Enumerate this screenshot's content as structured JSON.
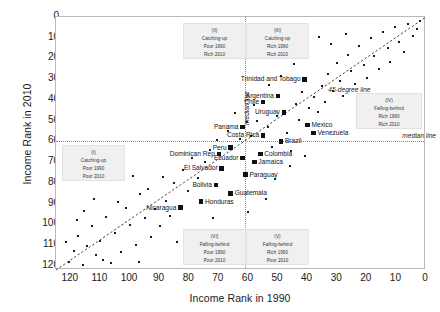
{
  "chart_data": {
    "type": "scatter",
    "title": "",
    "xlabel": "Income Rank in 1990",
    "ylabel": "Income Rank in 2010",
    "xlim": [
      125,
      0
    ],
    "ylim": [
      0,
      122
    ],
    "x_reversed": true,
    "y_reversed": true,
    "xticks": [
      120,
      110,
      100,
      90,
      80,
      70,
      60,
      50,
      40,
      30,
      20,
      10,
      0
    ],
    "yticks": [
      0,
      10,
      20,
      30,
      40,
      50,
      60,
      70,
      80,
      90,
      100,
      110,
      120
    ],
    "grid": false,
    "legend": "none",
    "reference_lines": [
      {
        "name": "45-degree line",
        "label": "45-degree line",
        "type": "identity"
      },
      {
        "name": "median line vertical",
        "label": "median line",
        "type": "vline",
        "value": 61
      },
      {
        "name": "median line horizontal",
        "label": "median line",
        "type": "hline",
        "value": 60
      }
    ],
    "labeled_points": [
      {
        "name": "Trinidad and Tobago",
        "x": 41,
        "y": 30,
        "side": "r"
      },
      {
        "name": "Argentina",
        "x": 50,
        "y": 38,
        "side": "r"
      },
      {
        "name": "Chile",
        "x": 55,
        "y": 41,
        "side": "r"
      },
      {
        "name": "Uruguay",
        "x": 48,
        "y": 46,
        "side": "r"
      },
      {
        "name": "Mexico",
        "x": 40,
        "y": 52,
        "side": "l"
      },
      {
        "name": "Venezuela",
        "x": 38,
        "y": 56,
        "side": "l"
      },
      {
        "name": "Panama",
        "x": 62,
        "y": 53,
        "side": "r"
      },
      {
        "name": "Costa Rica",
        "x": 55,
        "y": 57,
        "side": "r"
      },
      {
        "name": "Brazil",
        "x": 49,
        "y": 60,
        "side": "l"
      },
      {
        "name": "Peru",
        "x": 66,
        "y": 63,
        "side": "r"
      },
      {
        "name": "Colombia",
        "x": 56,
        "y": 66,
        "side": "l"
      },
      {
        "name": "Ecuador",
        "x": 62,
        "y": 68,
        "side": "r"
      },
      {
        "name": "Jamaica",
        "x": 58,
        "y": 70,
        "side": "l"
      },
      {
        "name": "Dominican Rep",
        "x": 70,
        "y": 66,
        "side": "r"
      },
      {
        "name": "El Salvador",
        "x": 69,
        "y": 73,
        "side": "r"
      },
      {
        "name": "Paraguay",
        "x": 61,
        "y": 76,
        "side": "l"
      },
      {
        "name": "Bolivia",
        "x": 71,
        "y": 81,
        "side": "r"
      },
      {
        "name": "Guatemala",
        "x": 66,
        "y": 85,
        "side": "l"
      },
      {
        "name": "Honduras",
        "x": 76,
        "y": 89,
        "side": "l"
      },
      {
        "name": "Nicaragua",
        "x": 83,
        "y": 92,
        "side": "r"
      }
    ],
    "unlabeled_points": [
      {
        "x": 60.5,
        "y": 50.5
      },
      {
        "x": 59.0,
        "y": 57.5
      },
      {
        "x": 57.0,
        "y": 50.0
      },
      {
        "x": 53.5,
        "y": 53.0
      },
      {
        "x": 52.0,
        "y": 62.5
      },
      {
        "x": 50.5,
        "y": 47.5
      },
      {
        "x": 47.0,
        "y": 56.0
      },
      {
        "x": 45.5,
        "y": 64.5
      },
      {
        "x": 44.0,
        "y": 42.0
      },
      {
        "x": 43.0,
        "y": 49.5
      },
      {
        "x": 42.0,
        "y": 36.0
      },
      {
        "x": 39.5,
        "y": 44.0
      },
      {
        "x": 38.0,
        "y": 38.5
      },
      {
        "x": 36.5,
        "y": 46.0
      },
      {
        "x": 35.0,
        "y": 33.5
      },
      {
        "x": 34.0,
        "y": 41.0
      },
      {
        "x": 33.0,
        "y": 27.5
      },
      {
        "x": 31.5,
        "y": 35.5
      },
      {
        "x": 30.0,
        "y": 22.0
      },
      {
        "x": 29.0,
        "y": 31.0
      },
      {
        "x": 28.0,
        "y": 38.0
      },
      {
        "x": 26.5,
        "y": 18.5
      },
      {
        "x": 25.5,
        "y": 26.0
      },
      {
        "x": 24.0,
        "y": 32.5
      },
      {
        "x": 22.5,
        "y": 14.0
      },
      {
        "x": 21.0,
        "y": 23.0
      },
      {
        "x": 20.0,
        "y": 29.5
      },
      {
        "x": 18.5,
        "y": 10.0
      },
      {
        "x": 17.5,
        "y": 19.0
      },
      {
        "x": 16.0,
        "y": 25.0
      },
      {
        "x": 14.5,
        "y": 7.0
      },
      {
        "x": 13.0,
        "y": 15.0
      },
      {
        "x": 12.0,
        "y": 21.5
      },
      {
        "x": 10.5,
        "y": 5.0
      },
      {
        "x": 9.0,
        "y": 12.0
      },
      {
        "x": 7.5,
        "y": 17.0
      },
      {
        "x": 6.0,
        "y": 3.5
      },
      {
        "x": 4.5,
        "y": 9.0
      },
      {
        "x": 3.0,
        "y": 6.0
      },
      {
        "x": 2.0,
        "y": 2.0
      },
      {
        "x": 36.0,
        "y": 9.5
      },
      {
        "x": 32.0,
        "y": 13.0
      },
      {
        "x": 27.0,
        "y": 8.0
      },
      {
        "x": 44.5,
        "y": 22.5
      },
      {
        "x": 49.0,
        "y": 28.5
      },
      {
        "x": 53.0,
        "y": 33.0
      },
      {
        "x": 58.0,
        "y": 42.5
      },
      {
        "x": 63.0,
        "y": 59.0
      },
      {
        "x": 64.5,
        "y": 46.5
      },
      {
        "x": 67.0,
        "y": 55.0
      },
      {
        "x": 70.5,
        "y": 59.5
      },
      {
        "x": 73.0,
        "y": 64.0
      },
      {
        "x": 74.5,
        "y": 70.0
      },
      {
        "x": 77.0,
        "y": 77.5
      },
      {
        "x": 79.0,
        "y": 68.0
      },
      {
        "x": 80.5,
        "y": 84.0
      },
      {
        "x": 82.0,
        "y": 74.0
      },
      {
        "x": 85.0,
        "y": 80.0
      },
      {
        "x": 86.5,
        "y": 96.0
      },
      {
        "x": 88.0,
        "y": 88.5
      },
      {
        "x": 90.0,
        "y": 101.0
      },
      {
        "x": 91.5,
        "y": 92.5
      },
      {
        "x": 93.0,
        "y": 106.0
      },
      {
        "x": 95.0,
        "y": 97.0
      },
      {
        "x": 96.5,
        "y": 85.5
      },
      {
        "x": 98.0,
        "y": 110.0
      },
      {
        "x": 100.0,
        "y": 100.5
      },
      {
        "x": 101.5,
        "y": 92.0
      },
      {
        "x": 103.0,
        "y": 113.5
      },
      {
        "x": 105.0,
        "y": 104.0
      },
      {
        "x": 106.5,
        "y": 118.5
      },
      {
        "x": 108.0,
        "y": 96.5
      },
      {
        "x": 110.0,
        "y": 108.0
      },
      {
        "x": 111.5,
        "y": 115.0
      },
      {
        "x": 113.0,
        "y": 101.0
      },
      {
        "x": 114.5,
        "y": 110.5
      },
      {
        "x": 116.0,
        "y": 119.5
      },
      {
        "x": 117.5,
        "y": 105.5
      },
      {
        "x": 119.0,
        "y": 113.0
      },
      {
        "x": 120.5,
        "y": 118.0
      },
      {
        "x": 118.0,
        "y": 98.0
      },
      {
        "x": 109.0,
        "y": 117.0
      },
      {
        "x": 104.0,
        "y": 89.0
      },
      {
        "x": 97.0,
        "y": 118.0
      },
      {
        "x": 68.5,
        "y": 113.5
      },
      {
        "x": 65.0,
        "y": 110.0
      },
      {
        "x": 59.5,
        "y": 103.0
      },
      {
        "x": 46.0,
        "y": 72.0
      },
      {
        "x": 41.0,
        "y": 67.0
      },
      {
        "x": 54.0,
        "y": 88.0
      },
      {
        "x": 89.0,
        "y": 77.0
      },
      {
        "x": 94.0,
        "y": 83.0
      },
      {
        "x": 99.0,
        "y": 76.5
      },
      {
        "x": 112.0,
        "y": 88.0
      },
      {
        "x": 115.5,
        "y": 93.5
      },
      {
        "x": 121.5,
        "y": 108.5
      },
      {
        "x": 72.0,
        "y": 97.0
      },
      {
        "x": 78.0,
        "y": 104.0
      },
      {
        "x": 84.0,
        "y": 108.5
      },
      {
        "x": 60.0,
        "y": 94.0
      },
      {
        "x": 51.0,
        "y": 78.0
      },
      {
        "x": 23.0,
        "y": 42.0
      }
    ],
    "quadrant_boxes": [
      {
        "id": "(I)",
        "line1": "Catching-up",
        "line2": "Poor 1990",
        "line3": "Poor 2010"
      },
      {
        "id": "(II)",
        "line1": "Catching-up",
        "line2": "Poor 1990",
        "line3": "Rich 2010"
      },
      {
        "id": "(III)",
        "line1": "Catching-up",
        "line2": "Rich 1990",
        "line3": "Rich 2010"
      },
      {
        "id": "(IV)",
        "line1": "Falling-behind",
        "line2": "Rich 1990",
        "line3": "Rich 2010"
      },
      {
        "id": "(V)",
        "line1": "Falling-behind",
        "line2": "Rich 1990",
        "line3": "Poor 2010"
      },
      {
        "id": "(VI)",
        "line1": "Falling-behind",
        "line2": "Poor 1990",
        "line3": "Poor 2010"
      }
    ]
  }
}
